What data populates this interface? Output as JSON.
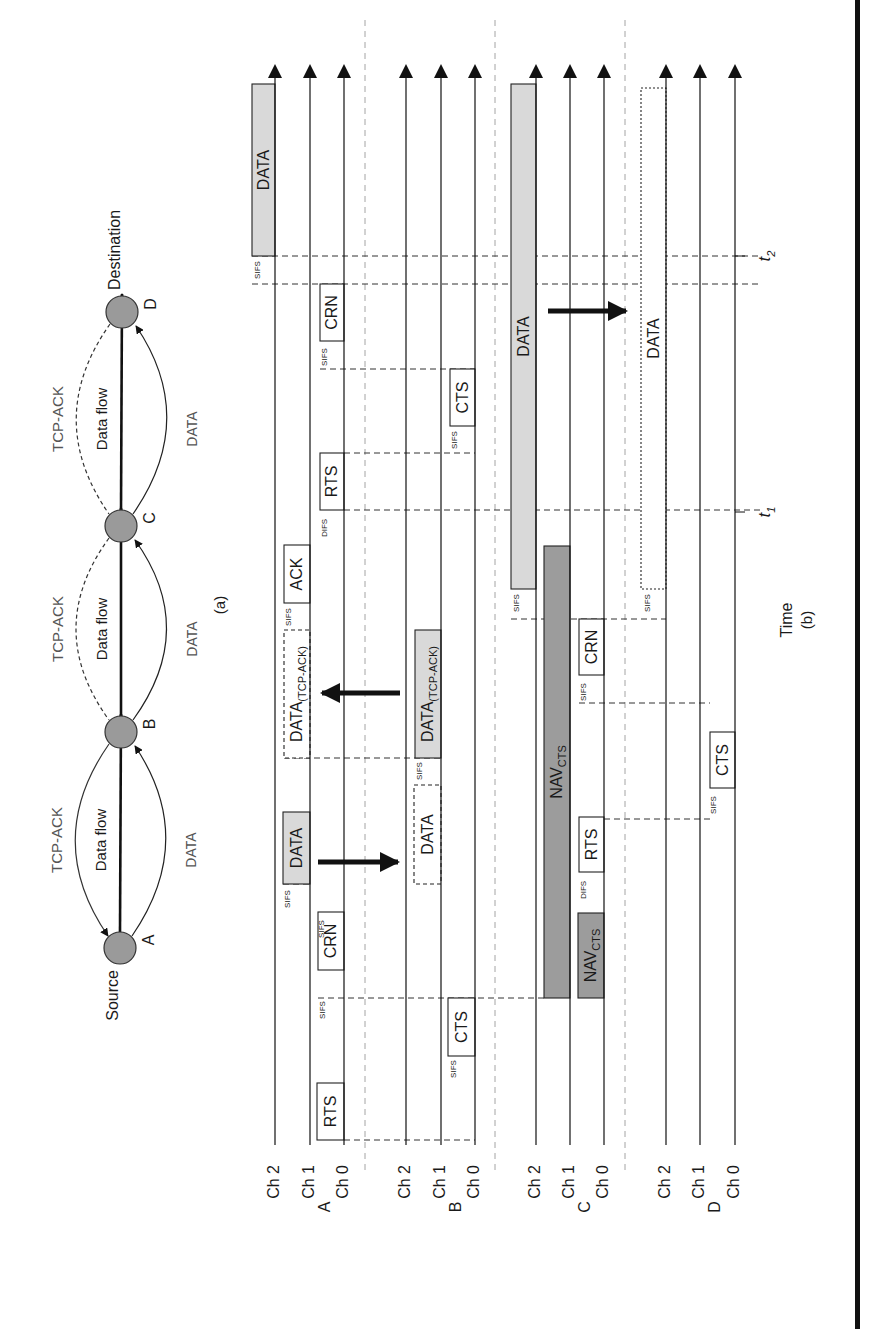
{
  "figure": {
    "panel_a_caption": "(a)",
    "panel_b_caption": "(b)",
    "time_axis_label": "Time",
    "time_markers": [
      {
        "label": "t",
        "sub": "1",
        "y": 512
      },
      {
        "label": "t",
        "sub": "2",
        "y": 256
      }
    ]
  },
  "topology": {
    "nodes": [
      {
        "id": "A",
        "label": "A",
        "role": "Source",
        "x": 120,
        "y": 948
      },
      {
        "id": "B",
        "label": "B",
        "role": "",
        "x": 121,
        "y": 732
      },
      {
        "id": "C",
        "label": "C",
        "role": "",
        "x": 121,
        "y": 526
      },
      {
        "id": "D",
        "label": "D",
        "role": "Destination",
        "x": 122,
        "y": 312
      }
    ],
    "links": [
      {
        "from": "A",
        "to": "B",
        "flow_label": "Data flow",
        "data_label": "DATA",
        "ack_label": "TCP-ACK",
        "ack_direction": "to-source"
      },
      {
        "from": "B",
        "to": "C",
        "flow_label": "Data flow",
        "data_label": "DATA",
        "ack_label": "TCP-ACK",
        "ack_direction": "none"
      },
      {
        "from": "C",
        "to": "D",
        "flow_label": "Data flow",
        "data_label": "DATA",
        "ack_label": "TCP-ACK",
        "ack_direction": "none"
      }
    ],
    "colors": {
      "node_fill": "#9a9a9a",
      "node_stroke": "#333333",
      "ack_color": "#555555",
      "data_label_color": "#555555"
    }
  },
  "timeline": {
    "axis_top_y": 70,
    "axis_bottom_y": 1145,
    "stations": [
      {
        "id": "A",
        "label": "A",
        "channels": [
          {
            "name": "Ch 2",
            "x": 275
          },
          {
            "name": "Ch 1",
            "x": 310
          },
          {
            "name": "Ch 0",
            "x": 344
          }
        ]
      },
      {
        "id": "B",
        "label": "B",
        "channels": [
          {
            "name": "Ch 2",
            "x": 406
          },
          {
            "name": "Ch 1",
            "x": 441
          },
          {
            "name": "Ch 0",
            "x": 475
          }
        ]
      },
      {
        "id": "C",
        "label": "C",
        "channels": [
          {
            "name": "Ch 2",
            "x": 536
          },
          {
            "name": "Ch 1",
            "x": 570
          },
          {
            "name": "Ch 0",
            "x": 604
          }
        ]
      },
      {
        "id": "D",
        "label": "D",
        "channels": [
          {
            "name": "Ch 2",
            "x": 666
          },
          {
            "name": "Ch 1",
            "x": 700
          },
          {
            "name": "Ch 0",
            "x": 735
          }
        ]
      }
    ],
    "separators_x": [
      365,
      495,
      625
    ],
    "frames": [
      {
        "station": "A",
        "label": "RTS",
        "sub": "",
        "x1": 317,
        "x2": 344,
        "y1": 1083,
        "y2": 1140,
        "style": "solid",
        "fill": "#ffffff"
      },
      {
        "station": "A",
        "label": "CRN",
        "sub": "",
        "x1": 318,
        "x2": 344,
        "y1": 912,
        "y2": 970,
        "style": "solid",
        "fill": "#ffffff"
      },
      {
        "station": "A",
        "label": "DATA",
        "sub": "",
        "x1": 283,
        "x2": 310,
        "y1": 812,
        "y2": 884,
        "style": "solid",
        "fill": "#d9d9d9"
      },
      {
        "station": "A",
        "label": "DATA",
        "sub": "(TCP-ACK)",
        "x1": 284,
        "x2": 310,
        "y1": 630,
        "y2": 758,
        "style": "dashed",
        "fill": "#ffffff"
      },
      {
        "station": "A",
        "label": "ACK",
        "sub": "",
        "x1": 284,
        "x2": 310,
        "y1": 545,
        "y2": 603,
        "style": "solid",
        "fill": "#ffffff"
      },
      {
        "station": "A",
        "label": "RTS",
        "sub": "",
        "x1": 320,
        "x2": 344,
        "y1": 453,
        "y2": 510,
        "style": "solid",
        "fill": "#ffffff"
      },
      {
        "station": "A",
        "label": "CRN",
        "sub": "",
        "x1": 320,
        "x2": 344,
        "y1": 284,
        "y2": 341,
        "style": "solid",
        "fill": "#ffffff"
      },
      {
        "station": "A",
        "label": "DATA",
        "sub": "",
        "x1": 252,
        "x2": 275,
        "y1": 84,
        "y2": 256,
        "style": "solid",
        "fill": "#d9d9d9"
      },
      {
        "station": "B",
        "label": "CTS",
        "sub": "",
        "x1": 448,
        "x2": 475,
        "y1": 998,
        "y2": 1056,
        "style": "solid",
        "fill": "#ffffff"
      },
      {
        "station": "B",
        "label": "DATA",
        "sub": "",
        "x1": 414,
        "x2": 441,
        "y1": 785,
        "y2": 884,
        "style": "dashed",
        "fill": "#ffffff"
      },
      {
        "station": "B",
        "label": "DATA",
        "sub": "(TCP-ACK)",
        "x1": 415,
        "x2": 441,
        "y1": 630,
        "y2": 758,
        "style": "solid",
        "fill": "#d9d9d9"
      },
      {
        "station": "B",
        "label": "CTS",
        "sub": "",
        "x1": 450,
        "x2": 475,
        "y1": 369,
        "y2": 426,
        "style": "solid",
        "fill": "#ffffff"
      },
      {
        "station": "C",
        "label": "NAV",
        "sub": "CTS",
        "x1": 578,
        "x2": 604,
        "y1": 913,
        "y2": 998,
        "style": "solid",
        "fill": "#9c9c9c"
      },
      {
        "station": "C",
        "label": "NAV",
        "sub": "CTS",
        "x1": 544,
        "x2": 570,
        "y1": 546,
        "y2": 998,
        "style": "solid",
        "fill": "#9c9c9c"
      },
      {
        "station": "C",
        "label": "RTS",
        "sub": "",
        "x1": 579,
        "x2": 604,
        "y1": 817,
        "y2": 872,
        "style": "solid",
        "fill": "#ffffff"
      },
      {
        "station": "C",
        "label": "CRN",
        "sub": "",
        "x1": 579,
        "x2": 604,
        "y1": 619,
        "y2": 675,
        "style": "solid",
        "fill": "#ffffff"
      },
      {
        "station": "C",
        "label": "DATA",
        "sub": "",
        "x1": 511,
        "x2": 536,
        "y1": 84,
        "y2": 589,
        "style": "solid",
        "fill": "#d9d9d9"
      },
      {
        "station": "D",
        "label": "CTS",
        "sub": "",
        "x1": 710,
        "x2": 735,
        "y1": 732,
        "y2": 788,
        "style": "solid",
        "fill": "#ffffff"
      },
      {
        "station": "D",
        "label": "DATA",
        "sub": "",
        "x1": 641,
        "x2": 666,
        "y1": 88,
        "y2": 589,
        "style": "dotted",
        "fill": "#ffffff"
      }
    ],
    "gap_labels": [
      {
        "text": "SIFS",
        "x": 323,
        "y": 1010
      },
      {
        "text": "SIFS",
        "x": 322,
        "y": 929
      },
      {
        "text": "SIFS",
        "x": 288,
        "y": 899
      },
      {
        "text": "SIFS",
        "x": 289,
        "y": 617
      },
      {
        "text": "DIFS",
        "x": 325,
        "y": 528
      },
      {
        "text": "SIFS",
        "x": 325,
        "y": 357
      },
      {
        "text": "SIFS",
        "x": 258,
        "y": 270
      },
      {
        "text": "SIFS",
        "x": 454,
        "y": 1069
      },
      {
        "text": "SIFS",
        "x": 420,
        "y": 771
      },
      {
        "text": "SIFS",
        "x": 455,
        "y": 440
      },
      {
        "text": "DIFS",
        "x": 584,
        "y": 890
      },
      {
        "text": "SIFS",
        "x": 584,
        "y": 692
      },
      {
        "text": "SIFS",
        "x": 517,
        "y": 603
      },
      {
        "text": "SIFS",
        "x": 648,
        "y": 603
      },
      {
        "text": "SIFS",
        "x": 714,
        "y": 805
      }
    ],
    "sync_lines": [
      {
        "y": 1140,
        "x1": 344,
        "x2": 475
      },
      {
        "y": 998,
        "x1": 318,
        "x2": 544
      },
      {
        "y": 884,
        "x1": 283,
        "x2": 310
      },
      {
        "y": 819,
        "x1": 604,
        "x2": 710
      },
      {
        "y": 758,
        "x1": 284,
        "x2": 441
      },
      {
        "y": 703,
        "x1": 579,
        "x2": 710
      },
      {
        "y": 619,
        "x1": 511,
        "x2": 666
      },
      {
        "y": 510,
        "x1": 344,
        "x2": 760
      },
      {
        "y": 453,
        "x1": 344,
        "x2": 475
      },
      {
        "y": 369,
        "x1": 320,
        "x2": 475
      },
      {
        "y": 284,
        "x1": 252,
        "x2": 760
      },
      {
        "y": 256,
        "x1": 252,
        "x2": 760
      }
    ],
    "transfer_arrows": [
      {
        "from_x": 318,
        "to_x": 398,
        "y": 862
      },
      {
        "from_x": 400,
        "to_x": 322,
        "y": 693
      },
      {
        "from_x": 548,
        "to_x": 626,
        "y": 311
      }
    ]
  }
}
